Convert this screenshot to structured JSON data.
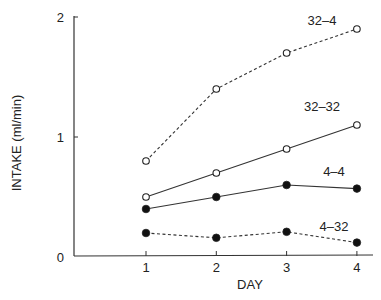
{
  "chart_data": {
    "type": "line",
    "title": "",
    "xlabel": "DAY",
    "ylabel": "INTAKE (ml/min)",
    "x": [
      1,
      2,
      3,
      4
    ],
    "x_ticks": [
      "1",
      "2",
      "3",
      "4"
    ],
    "y_ticks": [
      "0",
      "1",
      "2"
    ],
    "ylim": [
      0,
      2
    ],
    "xlim": [
      0,
      4.2
    ],
    "grid": false,
    "legend": "inline labels near line ends",
    "series": [
      {
        "name": "32–4",
        "values": [
          0.8,
          1.4,
          1.7,
          1.9
        ],
        "marker": "open-circle",
        "line": "dashed"
      },
      {
        "name": "32–32",
        "values": [
          0.5,
          0.7,
          0.9,
          1.1
        ],
        "marker": "open-circle",
        "line": "solid"
      },
      {
        "name": "4–4",
        "values": [
          0.4,
          0.5,
          0.6,
          0.57
        ],
        "marker": "filled-circle",
        "line": "solid"
      },
      {
        "name": "4–32",
        "values": [
          0.2,
          0.16,
          0.21,
          0.12
        ],
        "marker": "filled-circle",
        "line": "dashed"
      }
    ]
  }
}
